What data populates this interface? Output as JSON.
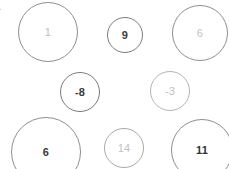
{
  "canvas": {
    "width": 229,
    "height": 169,
    "background": "#ffffff"
  },
  "edge_marker": {
    "text": "r",
    "color": "#9a9a9a",
    "left": -3,
    "top": 6,
    "font_size": 11
  },
  "chart_data": {
    "type": "scatter",
    "title": "",
    "subtitle": "",
    "xlabel": "",
    "ylabel": "",
    "grid": false,
    "legend": null,
    "note": "Grid of outlined circles (bubbles); each bubble is labelled with a signed integer value. Bubble radius encodes magnitude.",
    "categories": [
      "1",
      "9",
      "6",
      "-8",
      "-3",
      "6",
      "14",
      "11"
    ],
    "values": [
      1,
      9,
      6,
      -8,
      -3,
      6,
      14,
      11
    ],
    "points": [
      {
        "label": "1",
        "value": 1,
        "x": 48,
        "y": 32,
        "r": 30,
        "emphasis": "muted",
        "text_color": "#bdbdbd",
        "stroke": "#8e8e8e",
        "stroke_width": 1,
        "font_size": 11,
        "font_weight": "400"
      },
      {
        "label": "9",
        "value": 9,
        "x": 125,
        "y": 35,
        "r": 18,
        "emphasis": "strong",
        "text_color": "#3a3a3a",
        "stroke": "#7a7a7a",
        "stroke_width": 1,
        "font_size": 11,
        "font_weight": "700"
      },
      {
        "label": "6",
        "value": 6,
        "x": 200,
        "y": 33,
        "r": 28,
        "emphasis": "muted",
        "text_color": "#c2c2c2",
        "stroke": "#8e8e8e",
        "stroke_width": 1,
        "font_size": 11,
        "font_weight": "400"
      },
      {
        "label": "-8",
        "value": -8,
        "x": 80,
        "y": 92,
        "r": 20,
        "emphasis": "strong",
        "text_color": "#3a3a3a",
        "stroke": "#7a7a7a",
        "stroke_width": 1,
        "font_size": 11,
        "font_weight": "700"
      },
      {
        "label": "-3",
        "value": -3,
        "x": 170,
        "y": 91,
        "r": 20,
        "emphasis": "muted",
        "text_color": "#c2c2c2",
        "stroke": "#b4b4b4",
        "stroke_width": 1,
        "font_size": 11,
        "font_weight": "400"
      },
      {
        "label": "6",
        "value": 6,
        "x": 46,
        "y": 152,
        "r": 35,
        "emphasis": "strong",
        "text_color": "#3a3a3a",
        "stroke": "#8e8e8e",
        "stroke_width": 1,
        "font_size": 11,
        "font_weight": "700"
      },
      {
        "label": "14",
        "value": 14,
        "x": 124,
        "y": 148,
        "r": 20,
        "emphasis": "muted",
        "text_color": "#c2c2c2",
        "stroke": "#a8a8a8",
        "stroke_width": 1,
        "font_size": 11,
        "font_weight": "400"
      },
      {
        "label": "11",
        "value": 11,
        "x": 202,
        "y": 150,
        "r": 31,
        "emphasis": "strong",
        "text_color": "#333333",
        "stroke": "#8e8e8e",
        "stroke_width": 1,
        "font_size": 11,
        "font_weight": "700"
      }
    ]
  }
}
